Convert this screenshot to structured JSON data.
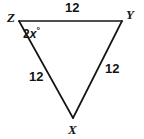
{
  "figure": {
    "type": "geometry-diagram",
    "shape": "triangle",
    "background_color": "#ffffff",
    "stroke_color": "#141414",
    "stroke_width": 1.6
  },
  "vertices": [
    {
      "name": "Z",
      "label": "Z",
      "x": 19,
      "y": 21
    },
    {
      "name": "Y",
      "label": "Y",
      "x": 122,
      "y": 21
    },
    {
      "name": "X",
      "label": "X",
      "x": 73,
      "y": 118
    }
  ],
  "sides": [
    {
      "name": "ZY",
      "label": "12",
      "from": "Z",
      "to": "Y"
    },
    {
      "name": "ZX",
      "label": "12",
      "from": "Z",
      "to": "X"
    },
    {
      "name": "YX",
      "label": "12",
      "from": "Y",
      "to": "X"
    }
  ],
  "angles": [
    {
      "name": "angle-Z",
      "at_vertex": "Z",
      "coefficient": "2",
      "variable": "x",
      "degree_symbol": "°",
      "full_label": "2x°"
    }
  ]
}
